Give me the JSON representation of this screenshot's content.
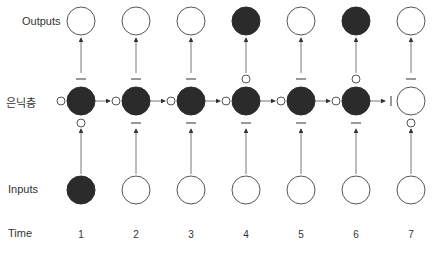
{
  "diagram": {
    "row_labels": {
      "outputs": "Outputs",
      "hidden": "은닉층",
      "inputs": "Inputs",
      "time": "Time"
    },
    "colors": {
      "filled": "#2b2b2b",
      "stroke": "#555555",
      "background": "#ffffff"
    },
    "columns": [
      {
        "time": "1",
        "input_filled": true,
        "hidden_filled": true,
        "output_filled": false,
        "gate_left": "open",
        "gate_top": "closed",
        "gate_bottom": "open"
      },
      {
        "time": "2",
        "input_filled": false,
        "hidden_filled": true,
        "output_filled": false,
        "gate_left": "open",
        "gate_top": "closed",
        "gate_bottom": "closed"
      },
      {
        "time": "3",
        "input_filled": false,
        "hidden_filled": true,
        "output_filled": false,
        "gate_left": "open",
        "gate_top": "closed",
        "gate_bottom": "closed"
      },
      {
        "time": "4",
        "input_filled": false,
        "hidden_filled": true,
        "output_filled": true,
        "gate_left": "open",
        "gate_top": "open",
        "gate_bottom": "closed"
      },
      {
        "time": "5",
        "input_filled": false,
        "hidden_filled": true,
        "output_filled": false,
        "gate_left": "open",
        "gate_top": "closed",
        "gate_bottom": "closed"
      },
      {
        "time": "6",
        "input_filled": false,
        "hidden_filled": true,
        "output_filled": true,
        "gate_left": "open",
        "gate_top": "open",
        "gate_bottom": "closed"
      },
      {
        "time": "7",
        "input_filled": false,
        "hidden_filled": false,
        "output_filled": false,
        "gate_left": "closed",
        "gate_top": "closed",
        "gate_bottom": "open"
      }
    ]
  }
}
